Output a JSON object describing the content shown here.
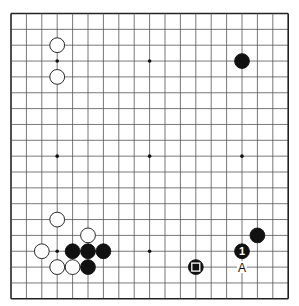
{
  "board": {
    "size": 19,
    "origin": {
      "x": 11,
      "y": 13.5
    },
    "spacing": {
      "x": 15.4,
      "y": 15.85
    },
    "line_color": "#555555",
    "border_color": "#222222",
    "star_points": [
      [
        3,
        3
      ],
      [
        9,
        3
      ],
      [
        15,
        3
      ],
      [
        3,
        9
      ],
      [
        9,
        9
      ],
      [
        15,
        9
      ],
      [
        3,
        15
      ],
      [
        9,
        15
      ],
      [
        15,
        15
      ]
    ]
  },
  "stones": [
    {
      "color": "white",
      "col": 3,
      "row": 2
    },
    {
      "color": "white",
      "col": 3,
      "row": 4
    },
    {
      "color": "black",
      "col": 15,
      "row": 3
    },
    {
      "color": "white",
      "col": 3,
      "row": 13
    },
    {
      "color": "white",
      "col": 5,
      "row": 14
    },
    {
      "color": "white",
      "col": 2,
      "row": 15
    },
    {
      "color": "black",
      "col": 4,
      "row": 15
    },
    {
      "color": "black",
      "col": 5,
      "row": 15
    },
    {
      "color": "black",
      "col": 6,
      "row": 15
    },
    {
      "color": "white",
      "col": 3,
      "row": 16
    },
    {
      "color": "white",
      "col": 4,
      "row": 16
    },
    {
      "color": "black",
      "col": 5,
      "row": 16
    },
    {
      "color": "black",
      "col": 12,
      "row": 16,
      "marker": "square"
    },
    {
      "color": "black",
      "col": 15,
      "row": 15,
      "label": "1"
    },
    {
      "color": "black",
      "col": 16,
      "row": 14
    }
  ],
  "labels": [
    {
      "text": "A",
      "col": 15,
      "row": 16
    }
  ]
}
